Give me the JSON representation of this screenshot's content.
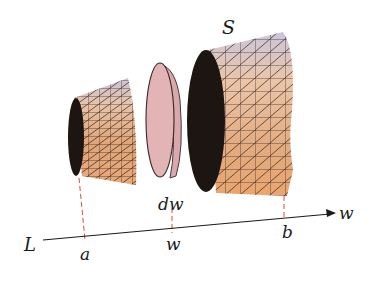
{
  "figure": {
    "title_label": "S",
    "axis": {
      "line_label": "L",
      "direction_label": "w",
      "ticks": [
        {
          "name": "a",
          "label": "a"
        },
        {
          "name": "w",
          "label": "w"
        },
        {
          "name": "b",
          "label": "b"
        }
      ]
    },
    "slice_label": "dw",
    "colors": {
      "solid_light": "#f2c9a6",
      "solid_mid": "#d89a6a",
      "solid_top": "#c9c3d8",
      "solid_dark_face": "#1c1512",
      "mesh_line": "#2a1c18",
      "disk_fill": "#e2b4b6",
      "disk_edge": "#3b2528",
      "dash_color": "#e0453c",
      "axis_color": "#1a1a1a"
    }
  }
}
